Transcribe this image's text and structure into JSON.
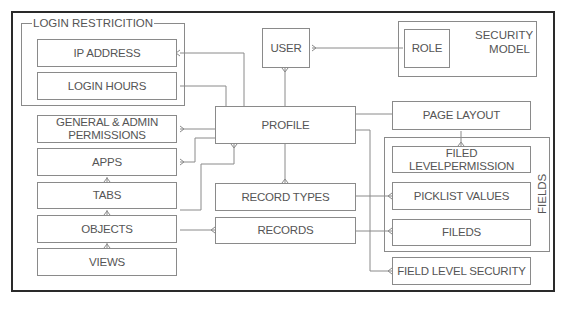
{
  "diagram": {
    "groups": {
      "login_restriction": "LOGIN RESTRICITION",
      "security_model": [
        "SECURITY",
        "MODEL"
      ],
      "fields": "FIELDS"
    },
    "boxes": {
      "ip_address": "IP ADDRESS",
      "login_hours": "LOGIN HOURS",
      "general_admin": [
        "GENERAL & ADMIN",
        "PERMISSIONS"
      ],
      "apps": "APPS",
      "tabs": "TABS",
      "objects": "OBJECTS",
      "views": "VIEWS",
      "user": "USER",
      "role": "ROLE",
      "profile": "PROFILE",
      "record_types": "RECORD TYPES",
      "records": "RECORDS",
      "page_layout": "PAGE LAYOUT",
      "filed_level_permission": "FILED LEVELPERMISSION",
      "picklist_values": "PICKLIST VALUES",
      "fileds": "FILEDS",
      "field_level_security": "FIELD LEVEL SECURITY"
    },
    "colors": {
      "frame": "#2a2a2a",
      "lines": "#8a8a8a",
      "text": "#555555"
    }
  }
}
